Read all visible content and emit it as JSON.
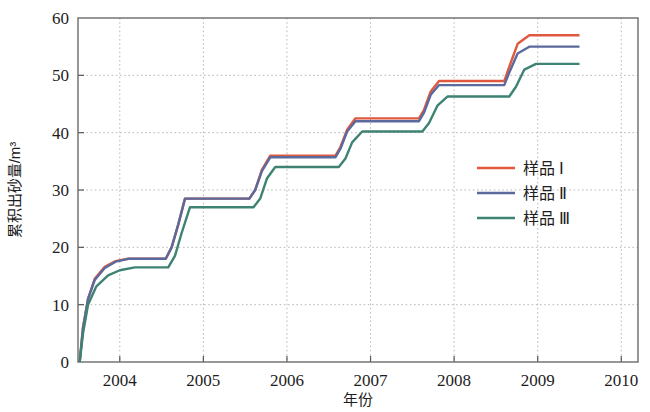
{
  "chart_data": {
    "type": "line",
    "title": "",
    "xlabel": "年份",
    "ylabel": "累积出砂量/m³",
    "xlim": [
      2003.5,
      2010.2
    ],
    "ylim": [
      0,
      60
    ],
    "xticks": [
      2004,
      2005,
      2006,
      2007,
      2008,
      2009,
      2010
    ],
    "xtick_labels": [
      "2004",
      "2005",
      "2006",
      "2007",
      "2008",
      "2009",
      "2010"
    ],
    "yticks": [
      0,
      10,
      20,
      30,
      40,
      50,
      60
    ],
    "ytick_labels": [
      "0",
      "10",
      "20",
      "30",
      "40",
      "50",
      "60"
    ],
    "grid": true,
    "legend_position": "center-right",
    "legend_entries": [
      "样品 Ⅰ",
      "样品 Ⅱ",
      "样品 Ⅲ"
    ],
    "series": [
      {
        "name": "样品 Ⅰ",
        "color": "#E0593F",
        "plateaus": [
          18.0,
          28.5,
          36.0,
          42.5,
          49.0,
          57.0
        ],
        "x": [
          2003.52,
          2003.56,
          2003.62,
          2003.7,
          2003.82,
          2003.95,
          2004.1,
          2004.55,
          2004.62,
          2004.7,
          2004.78,
          2005.55,
          2005.62,
          2005.7,
          2005.8,
          2006.58,
          2006.64,
          2006.72,
          2006.82,
          2007.58,
          2007.64,
          2007.72,
          2007.82,
          2008.6,
          2008.66,
          2008.76,
          2008.9,
          2009.5
        ],
        "y": [
          0.0,
          6.0,
          11.0,
          14.5,
          16.6,
          17.6,
          18.0,
          18.0,
          20.0,
          24.0,
          28.5,
          28.5,
          30.0,
          33.5,
          36.0,
          36.0,
          37.5,
          40.5,
          42.5,
          42.5,
          44.0,
          47.2,
          49.0,
          49.0,
          51.5,
          55.5,
          57.0,
          57.0
        ]
      },
      {
        "name": "样品 Ⅱ",
        "color": "#5A6A9E",
        "plateaus": [
          18.0,
          28.5,
          35.7,
          42.0,
          48.3,
          55.0
        ],
        "x": [
          2003.52,
          2003.56,
          2003.62,
          2003.7,
          2003.82,
          2003.95,
          2004.1,
          2004.55,
          2004.62,
          2004.7,
          2004.78,
          2005.55,
          2005.62,
          2005.7,
          2005.8,
          2006.58,
          2006.64,
          2006.72,
          2006.82,
          2007.58,
          2007.64,
          2007.72,
          2007.82,
          2008.6,
          2008.66,
          2008.76,
          2008.9,
          2009.5
        ],
        "y": [
          0.0,
          6.0,
          11.0,
          14.3,
          16.4,
          17.5,
          18.0,
          18.0,
          20.0,
          24.0,
          28.5,
          28.5,
          30.0,
          33.3,
          35.7,
          35.7,
          37.2,
          40.2,
          42.0,
          42.0,
          43.5,
          46.6,
          48.3,
          48.3,
          50.5,
          53.8,
          55.0,
          55.0
        ]
      },
      {
        "name": "样品 Ⅲ",
        "color": "#3D8272",
        "plateaus": [
          16.5,
          27.0,
          34.0,
          40.2,
          46.3,
          52.0
        ],
        "x": [
          2003.52,
          2003.56,
          2003.62,
          2003.72,
          2003.86,
          2004.0,
          2004.18,
          2004.58,
          2004.66,
          2004.74,
          2004.84,
          2005.6,
          2005.68,
          2005.76,
          2005.86,
          2006.62,
          2006.7,
          2006.78,
          2006.9,
          2007.62,
          2007.7,
          2007.8,
          2007.92,
          2008.66,
          2008.74,
          2008.84,
          2008.98,
          2009.5
        ],
        "y": [
          0.0,
          5.0,
          10.0,
          13.2,
          15.1,
          16.0,
          16.5,
          16.5,
          18.5,
          22.5,
          27.0,
          27.0,
          28.5,
          32.0,
          34.0,
          34.0,
          35.5,
          38.3,
          40.2,
          40.2,
          41.7,
          44.7,
          46.3,
          46.3,
          48.0,
          51.0,
          52.0,
          52.0
        ]
      }
    ]
  }
}
